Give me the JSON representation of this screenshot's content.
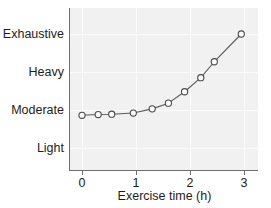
{
  "chart_data": {
    "type": "line",
    "title": "",
    "xlabel": "Exercise time (h)",
    "ylabel": "",
    "xlim": [
      -0.1,
      3.3
    ],
    "ylim": [
      0.45,
      4.15
    ],
    "grid": true,
    "legend": null,
    "x_tick_labels": [
      "0",
      "1",
      "2",
      "3"
    ],
    "x_tick_values": [
      0,
      1,
      2,
      3
    ],
    "y_tick_labels": [
      "Light",
      "Moderate",
      "Heavy",
      "Exhaustive"
    ],
    "y_tick_values": [
      1,
      2,
      3,
      4
    ],
    "series": [
      {
        "name": "Perceived exertion",
        "marker": "open-circle",
        "x": [
          0.0,
          0.3,
          0.55,
          0.95,
          1.3,
          1.6,
          1.9,
          2.2,
          2.45,
          2.95
        ],
        "y": [
          1.86,
          1.88,
          1.89,
          1.92,
          2.03,
          2.18,
          2.48,
          2.85,
          3.27,
          4.0
        ],
        "y_value_labels": [
          "Moderate",
          "Moderate",
          "Moderate",
          "Moderate",
          "Moderate",
          "Moderate",
          "Moderate+",
          "Heavy-",
          "Heavy",
          "Exhaustive"
        ]
      }
    ]
  },
  "axes": {
    "x_title": "Exercise time (h)",
    "y_categories": [
      {
        "label": "Exhaustive",
        "value": 4
      },
      {
        "label": "Heavy",
        "value": 3
      },
      {
        "label": "Moderate",
        "value": 2
      },
      {
        "label": "Light",
        "value": 1
      }
    ],
    "x_ticks": [
      {
        "label": "0",
        "value": 0
      },
      {
        "label": "1",
        "value": 1
      },
      {
        "label": "2",
        "value": 2
      },
      {
        "label": "3",
        "value": 3
      }
    ]
  },
  "style": {
    "panel_background": "#f1f1f1",
    "gridline_color": "#fbfbfb",
    "axis_color": "#6e6e6e",
    "line_color": "#5a5a5a",
    "marker_fill": "#ffffff",
    "marker_stroke": "#4a4a4a",
    "text_color": "#1c1c1c",
    "figure_background": "#ffffff"
  }
}
